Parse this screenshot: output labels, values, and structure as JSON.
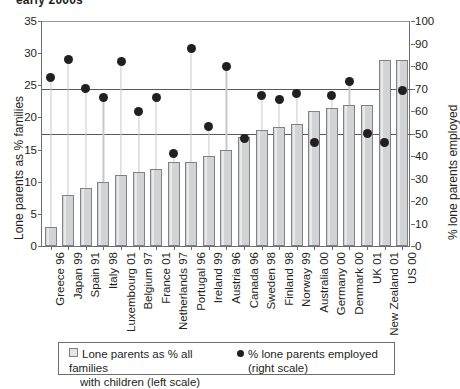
{
  "title": "early 2000s",
  "axes": {
    "left_label": "Lone parents as % families",
    "right_label": "% lone parents employed",
    "left_ticks": [
      0,
      5,
      10,
      15,
      20,
      25,
      30,
      35
    ],
    "right_ticks": [
      0,
      10,
      20,
      30,
      40,
      50,
      60,
      70,
      80,
      90,
      100
    ]
  },
  "legend": {
    "bar_line1": "Lone parents as % all families",
    "bar_line2": "with children (left scale)",
    "dot_line1": "% lone parents employed",
    "dot_line2": "(right scale)"
  },
  "chart_data": {
    "type": "bar",
    "title": "early 2000s",
    "xlabel": "",
    "ylabel": "Lone parents as % families",
    "y2label": "% lone parents employed",
    "ylim": [
      0,
      35
    ],
    "y2lim": [
      0,
      100
    ],
    "grid": false,
    "legend_position": "bottom",
    "reference_lines": [
      {
        "left_scale": 24.5,
        "right_scale": 70
      },
      {
        "left_scale": 17.5,
        "right_scale": 50
      }
    ],
    "categories": [
      "Greece 96",
      "Japan 99",
      "Spain 91",
      "Italy 98",
      "Luxembourg 01",
      "Belgium 97",
      "France 01",
      "Netherlands 97",
      "Portugal 96",
      "Ireland 99",
      "Austria 96",
      "Canada 96",
      "Sweden 98",
      "Finland 98",
      "Norway 99",
      "Australia 00",
      "Germany 00",
      "Denmark 00",
      "UK 01",
      "New Zealand 01",
      "US 00"
    ],
    "series": [
      {
        "name": "Lone parents as % all families with children (left scale)",
        "axis": "left",
        "type": "bar",
        "values": [
          3,
          8,
          9,
          10,
          11,
          11.5,
          12,
          13,
          13,
          14,
          15,
          17,
          18,
          18.5,
          19,
          21,
          21.5,
          22,
          22,
          29,
          29
        ]
      },
      {
        "name": "% lone parents employed (right scale)",
        "axis": "right",
        "type": "scatter",
        "values": [
          75,
          83,
          70,
          66,
          82,
          60,
          66,
          41,
          88,
          53,
          80,
          48,
          67,
          65,
          68,
          46,
          67,
          73,
          50,
          46,
          69
        ]
      }
    ]
  }
}
